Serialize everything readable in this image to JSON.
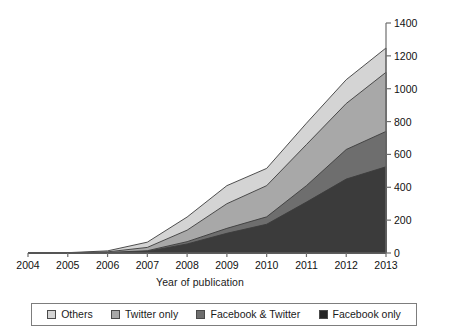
{
  "chart_data": {
    "type": "area",
    "stacked": true,
    "title": "",
    "xlabel": "Year of publication",
    "ylabel": "No. of articles/year",
    "categories": [
      2004,
      2005,
      2006,
      2007,
      2008,
      2009,
      2010,
      2011,
      2012,
      2013
    ],
    "x_tick_labels": [
      "2004",
      "2005",
      "2006",
      "2007",
      "2008",
      "2009",
      "2010",
      "2011",
      "2012",
      "2013"
    ],
    "y_tick_labels": [
      "0",
      "200",
      "400",
      "600",
      "800",
      "1000",
      "1200",
      "1400"
    ],
    "y_ticks": [
      0,
      200,
      400,
      600,
      800,
      1000,
      1200,
      1400
    ],
    "ylim": [
      0,
      1400
    ],
    "xlim": [
      2004,
      2013
    ],
    "y_axis_position": "right",
    "grid": false,
    "legend_position": "bottom",
    "series": [
      {
        "name": "Facebook only",
        "color": "#3b3b3b",
        "values": [
          0,
          0,
          2,
          10,
          55,
          120,
          175,
          310,
          450,
          525
        ]
      },
      {
        "name": "Facebook & Twitter",
        "color": "#6e6e6e",
        "values": [
          0,
          0,
          1,
          4,
          14,
          30,
          45,
          100,
          180,
          215
        ]
      },
      {
        "name": "Twitter only",
        "color": "#a8a8a8",
        "values": [
          0,
          1,
          4,
          20,
          70,
          150,
          190,
          250,
          280,
          360
        ]
      },
      {
        "name": "Others",
        "color": "#d4d4d4",
        "values": [
          0,
          1,
          6,
          32,
          80,
          110,
          105,
          130,
          145,
          148
        ]
      }
    ],
    "cumulative_tops": {
      "facebook_only": [
        0,
        0,
        2,
        10,
        55,
        120,
        175,
        310,
        450,
        525
      ],
      "facebook_twitter": [
        0,
        0,
        3,
        14,
        69,
        150,
        220,
        410,
        630,
        740
      ],
      "twitter_only": [
        0,
        1,
        7,
        34,
        139,
        300,
        410,
        660,
        910,
        1100
      ],
      "others": [
        0,
        2,
        13,
        66,
        219,
        410,
        515,
        790,
        1055,
        1248
      ]
    }
  },
  "legend": {
    "items": [
      {
        "label": "Others",
        "color": "#d4d4d4"
      },
      {
        "label": "Twitter only",
        "color": "#a8a8a8"
      },
      {
        "label": "Facebook & Twitter",
        "color": "#6e6e6e"
      },
      {
        "label": "Facebook only",
        "color": "#252525"
      }
    ]
  }
}
